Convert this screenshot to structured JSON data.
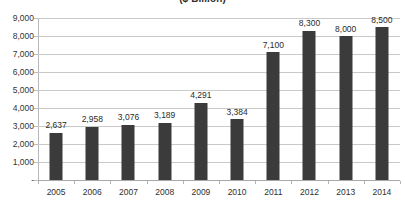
{
  "chart_data": {
    "type": "bar",
    "title": "($ Billion)",
    "xlabel": "",
    "ylabel": "",
    "categories": [
      "2005",
      "2006",
      "2007",
      "2008",
      "2009",
      "2010",
      "2011",
      "2012",
      "2013",
      "2014"
    ],
    "values": [
      2637,
      2958,
      3076,
      3189,
      4291,
      3384,
      7100,
      8300,
      8000,
      8500
    ],
    "value_labels": [
      "2,637",
      "2,958",
      "3,076",
      "3,189",
      "4,291",
      "3,384",
      "7,100",
      "8,300",
      "8,000",
      "8,500"
    ],
    "ylim": [
      0,
      9000
    ],
    "ytick_values": [
      9000,
      8000,
      7000,
      6000,
      5000,
      4000,
      3000,
      2000,
      1000,
      0
    ],
    "ytick_labels": [
      "9,000",
      "8,000",
      "7,000",
      "6,000",
      "5,000",
      "4,000",
      "3,000",
      "2,000",
      "1,000",
      "-"
    ],
    "grid": true,
    "legend": false,
    "legend_position": "none",
    "series": [
      {
        "name": "",
        "values": [
          2637,
          2958,
          3076,
          3189,
          4291,
          3384,
          7100,
          8300,
          8000,
          8500
        ]
      }
    ],
    "colors": {
      "bar": "#3b3b3b",
      "gridline": "#c9c9c9",
      "axis": "#a8a8a8",
      "text": "#2b2b2b",
      "background": "#ffffff"
    }
  }
}
